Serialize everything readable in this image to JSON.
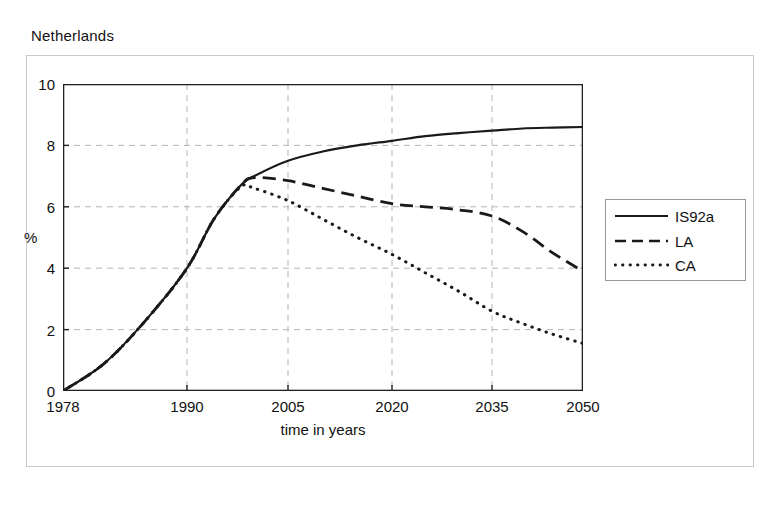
{
  "figure": {
    "title": "Netherlands",
    "bottom_fragment": ""
  },
  "axes": {
    "y_unit_label": "%",
    "x_title": "time in years",
    "y_ticks": [
      "0",
      "2",
      "4",
      "6",
      "8",
      "10"
    ],
    "x_ticks": [
      "1978",
      "1990",
      "2005",
      "2020",
      "2035",
      "2050"
    ]
  },
  "legend": {
    "items": [
      {
        "label": "IS92a",
        "style": "solid"
      },
      {
        "label": "LA",
        "style": "dashed"
      },
      {
        "label": "CA",
        "style": "dotted"
      }
    ]
  },
  "colors": {
    "line": "#1a1a1a",
    "grid": "#b5b5b5",
    "axis": "#222222",
    "frame": "#c9c9c9"
  },
  "chart_data": {
    "type": "line",
    "title": "Netherlands",
    "xlabel": "time in years",
    "ylabel": "%",
    "xlim": [
      1978,
      2050
    ],
    "ylim": [
      0,
      10
    ],
    "grid": true,
    "legend_position": "right-outside",
    "x_tick_values": [
      1978,
      1990,
      2005,
      2020,
      2035,
      2050
    ],
    "y_tick_values": [
      0,
      2,
      4,
      6,
      8,
      10
    ],
    "x": [
      1978,
      1982,
      1986,
      1990,
      1994,
      1998,
      2000,
      2005,
      2010,
      2015,
      2020,
      2025,
      2030,
      2035,
      2040,
      2045,
      2050
    ],
    "series": [
      {
        "name": "IS92a",
        "style": "solid",
        "values": [
          0.0,
          0.9,
          2.3,
          4.0,
          5.6,
          6.7,
          7.0,
          7.5,
          7.8,
          8.0,
          8.15,
          8.3,
          8.4,
          8.48,
          8.55,
          8.58,
          8.6
        ]
      },
      {
        "name": "LA",
        "style": "dashed",
        "values": [
          0.0,
          0.9,
          2.3,
          4.0,
          5.6,
          6.7,
          6.95,
          6.85,
          6.6,
          6.35,
          6.1,
          6.0,
          5.9,
          5.7,
          5.2,
          4.5,
          3.9
        ]
      },
      {
        "name": "CA",
        "style": "dotted",
        "values": [
          0.0,
          0.9,
          2.3,
          4.0,
          5.6,
          6.65,
          6.6,
          6.2,
          5.6,
          5.0,
          4.45,
          3.85,
          3.25,
          2.6,
          2.2,
          1.85,
          1.55
        ]
      }
    ]
  }
}
